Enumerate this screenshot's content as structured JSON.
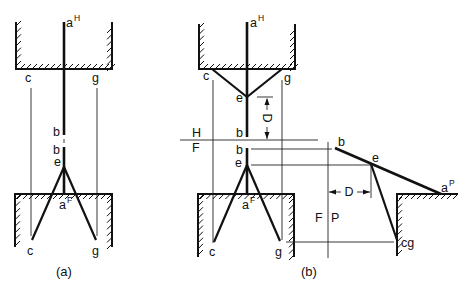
{
  "figure_a": {
    "caption": "(a)",
    "top_view": {
      "a_label": "a",
      "a_sup": "H",
      "c": "c",
      "g": "g",
      "b": "b"
    },
    "front_view": {
      "b": "b",
      "e": "e",
      "a_label": "a",
      "a_sup": "F",
      "c": "c",
      "g": "g"
    }
  },
  "figure_b": {
    "caption": "(b)",
    "top_view": {
      "a_label": "a",
      "a_sup": "H",
      "c": "c",
      "g": "g",
      "e": "e",
      "b": "b",
      "dimension": "D"
    },
    "reference_line": {
      "above": "H",
      "below": "F"
    },
    "front_view": {
      "b": "b",
      "e": "e",
      "a_label": "a",
      "a_sup": "F",
      "c": "c",
      "g": "g"
    },
    "auxiliary_reference_line": {
      "left": "F",
      "right": "P"
    },
    "auxiliary_view": {
      "b": "b",
      "e": "e",
      "a_label": "a",
      "a_sup": "P",
      "cg": "cg",
      "dimension": "D"
    }
  }
}
